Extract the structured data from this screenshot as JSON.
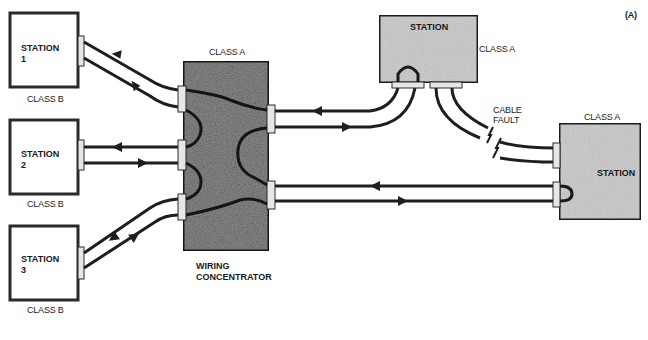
{
  "figure_label": "(A)",
  "colors": {
    "line": "#1e1e1e",
    "box_border": "#2a2a2a",
    "concentrator_fill": "#8a8a8a",
    "station_a_fill": "#cfcfcf",
    "connector_fill": "#e6e6e6",
    "background": "#ffffff"
  },
  "class_b_stations": [
    {
      "name": "STATION",
      "number": "1",
      "class": "CLASS B"
    },
    {
      "name": "STATION",
      "number": "2",
      "class": "CLASS B"
    },
    {
      "name": "STATION",
      "number": "3",
      "class": "CLASS B"
    }
  ],
  "concentrator": {
    "class": "CLASS A",
    "label_line1": "WIRING",
    "label_line2": "CONCENTRATOR"
  },
  "top_station": {
    "name": "STATION",
    "class": "CLASS A"
  },
  "right_station": {
    "name": "STATION",
    "class": "CLASS A"
  },
  "cable_fault": {
    "line1": "CABLE",
    "line2": "FAULT"
  }
}
